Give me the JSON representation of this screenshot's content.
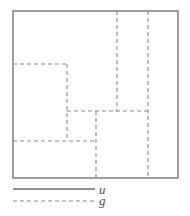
{
  "figure": {
    "name": "partition-diagram",
    "colors": {
      "solid_line": "#6b6b6b",
      "dashed_line": "#8a8a8a",
      "background": "#ffffff",
      "label_text": "#4d4d4d"
    },
    "outer_square": {
      "name": "domain-boundary",
      "x": 13,
      "y": 11,
      "width": 165,
      "height": 167,
      "stroke_width": 1.3
    },
    "dashed_segments": [
      {
        "name": "vertical-interface-right-outer",
        "x1": 148,
        "y1": 11,
        "x2": 148,
        "y2": 178
      },
      {
        "name": "vertical-interface-upper-mid",
        "x1": 117,
        "y1": 11,
        "x2": 117,
        "y2": 111
      },
      {
        "name": "horizontal-interface-upper-left",
        "x1": 13,
        "y1": 64,
        "x2": 67,
        "y2": 64
      },
      {
        "name": "vertical-interface-left-mid",
        "x1": 67,
        "y1": 64,
        "x2": 67,
        "y2": 141
      },
      {
        "name": "horizontal-interface-middle",
        "x1": 67,
        "y1": 111,
        "x2": 148,
        "y2": 111
      },
      {
        "name": "horizontal-interface-lower-left",
        "x1": 13,
        "y1": 141,
        "x2": 96,
        "y2": 141
      },
      {
        "name": "vertical-interface-lower-mid",
        "x1": 96,
        "y1": 111,
        "x2": 96,
        "y2": 178
      }
    ],
    "dash_pattern": "4,3",
    "dash_stroke_width": 1.1
  },
  "legend": {
    "name": "legend",
    "entries": [
      {
        "name": "legend-entry-u",
        "label": "u",
        "style": "solid",
        "swatch": {
          "x1": 13,
          "y1": 189,
          "x2": 95,
          "y2": 189
        }
      },
      {
        "name": "legend-entry-g",
        "label": "g",
        "style": "dashed",
        "swatch": {
          "x1": 13,
          "y1": 201,
          "x2": 95,
          "y2": 201
        }
      }
    ]
  }
}
